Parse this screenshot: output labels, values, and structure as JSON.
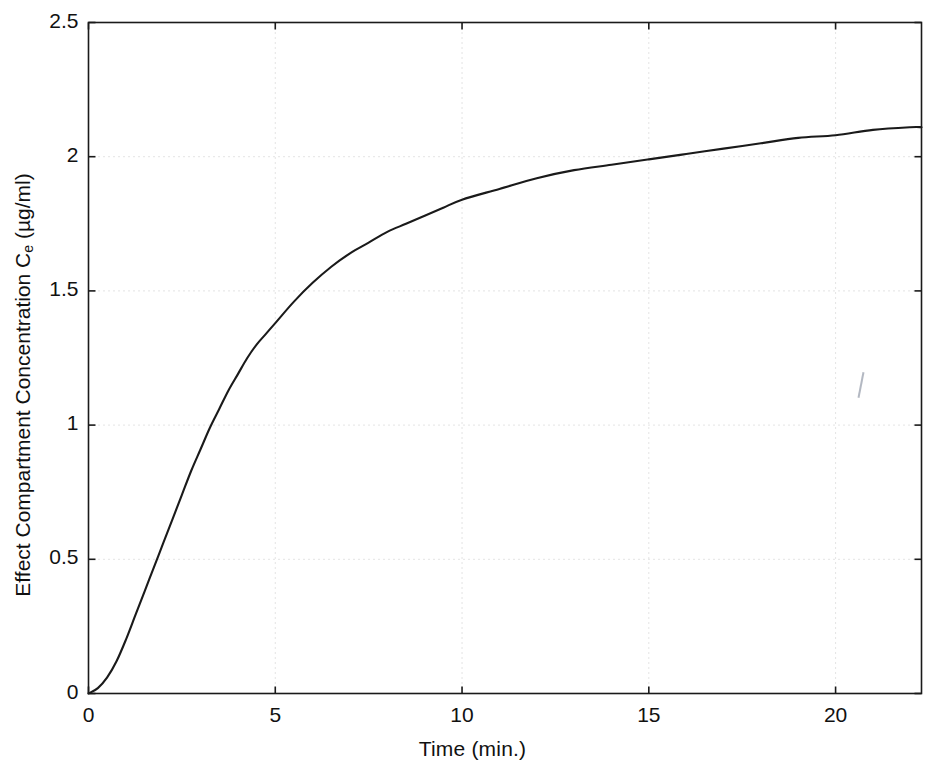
{
  "figure": {
    "background": "#ffffff",
    "line_color": "#1a1a1a",
    "axis_color": "#1a1a1a",
    "grid_color": "#c8c8c8"
  },
  "axes": {
    "xlabel": "Time (min.)",
    "ylabel_prefix": "Effect Compartment Concentration C",
    "ylabel_sub": "e",
    "ylabel_suffix": " (µg/ml)",
    "xticks": [
      "0",
      "5",
      "10",
      "15",
      "20"
    ],
    "yticks": [
      "0",
      "0.5",
      "1",
      "1.5",
      "2",
      "2.5"
    ]
  },
  "chart_data": {
    "type": "line",
    "title": "",
    "xlabel": "Time (min.)",
    "ylabel": "Effect Compartment Concentration Ce (µg/ml)",
    "xlim": [
      0,
      22.3
    ],
    "ylim": [
      0,
      2.5
    ],
    "xticks": [
      0,
      5,
      10,
      15,
      20
    ],
    "yticks": [
      0,
      0.5,
      1,
      1.5,
      2,
      2.5
    ],
    "grid": true,
    "grid_style": "dotted",
    "legend": null,
    "series": [
      {
        "name": "Effect compartment concentration",
        "x": [
          0,
          0.25,
          0.5,
          0.75,
          1,
          1.25,
          1.5,
          1.75,
          2,
          2.25,
          2.5,
          2.75,
          3,
          3.25,
          3.5,
          3.75,
          4,
          4.25,
          4.5,
          4.75,
          5,
          5.5,
          6,
          6.5,
          7,
          7.5,
          8,
          8.5,
          9,
          9.5,
          10,
          11,
          12,
          13,
          14,
          15,
          16,
          17,
          18,
          19,
          20,
          21,
          22,
          22.3
        ],
        "y": [
          0,
          0.02,
          0.06,
          0.12,
          0.2,
          0.29,
          0.38,
          0.47,
          0.56,
          0.65,
          0.74,
          0.83,
          0.91,
          0.99,
          1.06,
          1.13,
          1.19,
          1.25,
          1.3,
          1.34,
          1.38,
          1.46,
          1.53,
          1.59,
          1.64,
          1.68,
          1.72,
          1.75,
          1.78,
          1.81,
          1.84,
          1.88,
          1.92,
          1.95,
          1.97,
          1.99,
          2.01,
          2.03,
          2.05,
          2.07,
          2.08,
          2.1,
          2.11,
          2.11
        ]
      }
    ]
  }
}
